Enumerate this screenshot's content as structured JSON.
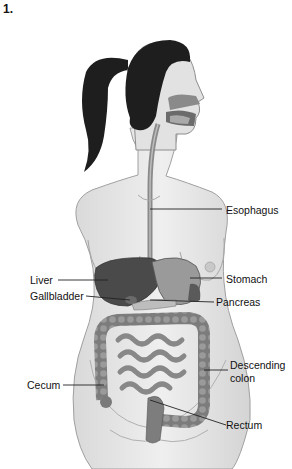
{
  "figure_number": "1.",
  "labels": {
    "esophagus": "Esophagus",
    "stomach": "Stomach",
    "liver": "Liver",
    "gallbladder": "Gallbladder",
    "pancreas": "Pancreas",
    "descending_colon_1": "Descending",
    "descending_colon_2": "colon",
    "cecum": "Cecum",
    "rectum": "Rectum"
  },
  "colors": {
    "skin": "#e6e6e6",
    "outline": "#9a9a9a",
    "hair": "#1e1e1e",
    "organ_dark": "#4a4a4a",
    "organ_mid": "#7a7a7a",
    "intestine": "#8c8c8c",
    "leader_line": "#222222"
  }
}
